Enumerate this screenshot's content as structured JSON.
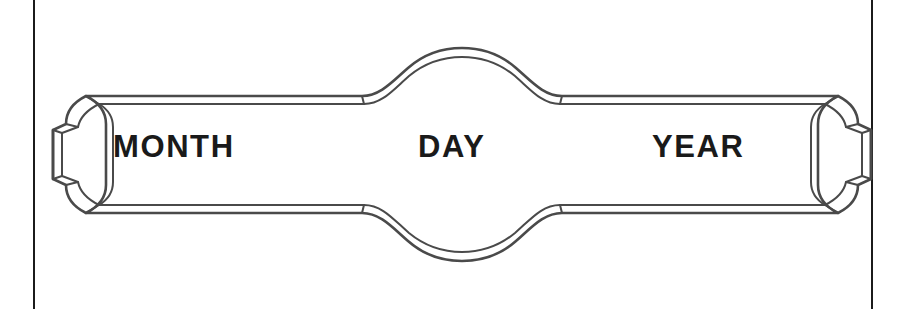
{
  "page": {
    "width": 898,
    "height": 309,
    "background_color": "#ffffff"
  },
  "rules": {
    "name": "vertical-page-rules",
    "color": "#1b1b1b",
    "left_x": 33,
    "right_x": 871,
    "thickness": 2
  },
  "banner": {
    "name": "decorative-date-cartouche",
    "shape": "double-line ribbon banner with arched center and flared bracket finials",
    "stroke_color": "#4a4a4a",
    "fill_color": "#ffffff",
    "stroke_width": 2.6,
    "inner_stroke_width": 2.0
  },
  "labels": {
    "month": "MONTH",
    "day": "DAY",
    "year": "YEAR"
  },
  "fields": [
    {
      "key": "month",
      "label": "MONTH",
      "value": ""
    },
    {
      "key": "day",
      "label": "DAY",
      "value": ""
    },
    {
      "key": "year",
      "label": "YEAR",
      "value": ""
    }
  ]
}
